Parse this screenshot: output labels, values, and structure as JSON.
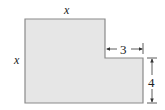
{
  "diagram": {
    "type": "L-shaped region",
    "labels": {
      "top_side": "x",
      "left_side": "x",
      "notch_width": "3",
      "notch_height": "4"
    },
    "colors": {
      "fill": "#e6e6e6",
      "stroke": "#8a8a8a",
      "dimension": "#333333"
    }
  }
}
